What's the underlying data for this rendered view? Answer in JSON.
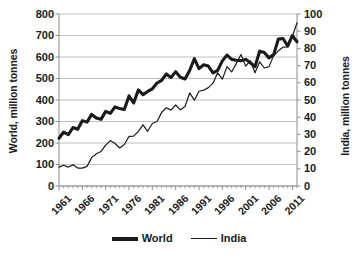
{
  "chart_data": {
    "type": "line",
    "title": "",
    "xlabel": "",
    "ylabel": "World, million tonnes",
    "y2label": "India, million tonnes",
    "grid": true,
    "legend_position": "bottom",
    "xlim": [
      1961,
      2012
    ],
    "ylim": [
      0,
      800
    ],
    "y2lim": [
      0,
      100
    ],
    "yticks": [
      0,
      100,
      200,
      300,
      400,
      500,
      600,
      700,
      800
    ],
    "y2ticks": [
      0,
      10,
      20,
      30,
      40,
      50,
      60,
      70,
      80,
      90,
      100
    ],
    "xticks": [
      1961,
      1966,
      1971,
      1976,
      1981,
      1986,
      1991,
      1996,
      2001,
      2006,
      2011
    ],
    "x": [
      1961,
      1962,
      1963,
      1964,
      1965,
      1966,
      1967,
      1968,
      1969,
      1970,
      1971,
      1972,
      1973,
      1974,
      1975,
      1976,
      1977,
      1978,
      1979,
      1980,
      1981,
      1982,
      1983,
      1984,
      1985,
      1986,
      1987,
      1988,
      1989,
      1990,
      1991,
      1992,
      1993,
      1994,
      1995,
      1996,
      1997,
      1998,
      1999,
      2000,
      2001,
      2002,
      2003,
      2004,
      2005,
      2006,
      2007,
      2008,
      2009,
      2010,
      2011,
      2012
    ],
    "series": [
      {
        "name": "World",
        "axis": "left",
        "unit": "million tonnes",
        "line_width": "thick",
        "color": "#1a1a1a",
        "values": [
          222,
          251,
          239,
          272,
          264,
          304,
          297,
          333,
          316,
          310,
          347,
          338,
          368,
          360,
          356,
          419,
          386,
          447,
          425,
          440,
          452,
          479,
          491,
          521,
          504,
          532,
          506,
          498,
          537,
          592,
          546,
          564,
          558,
          526,
          538,
          582,
          609,
          589,
          585,
          583,
          589,
          573,
          555,
          627,
          621,
          596,
          611,
          683,
          686,
          651,
          699,
          671
        ]
      },
      {
        "name": "India",
        "axis": "right",
        "unit": "million tonnes",
        "line_width": "thin",
        "color": "#1a1a1a",
        "values": [
          11.0,
          12.1,
          11.0,
          12.3,
          10.4,
          10.4,
          11.4,
          16.5,
          18.7,
          20.1,
          23.8,
          26.4,
          24.7,
          22.1,
          24.1,
          28.8,
          29.0,
          31.8,
          35.5,
          31.8,
          36.3,
          37.5,
          42.8,
          45.5,
          44.1,
          47.1,
          44.3,
          46.2,
          54.1,
          49.9,
          55.1,
          55.7,
          57.2,
          59.8,
          65.8,
          62.1,
          69.4,
          66.3,
          71.3,
          76.4,
          69.7,
          72.8,
          65.8,
          72.2,
          68.6,
          69.4,
          75.8,
          78.6,
          80.7,
          80.8,
          86.9,
          94.9
        ]
      }
    ]
  },
  "legend": {
    "items": [
      {
        "label": "World",
        "style": "thick"
      },
      {
        "label": "India",
        "style": "thin"
      }
    ]
  },
  "colors": {
    "line": "#1a1a1a",
    "grid": "#b8b8b8",
    "axis": "#8c8c8c",
    "background": "#ffffff"
  }
}
